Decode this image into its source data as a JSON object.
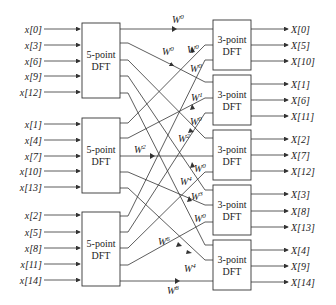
{
  "diagram": {
    "stage1_blocks": [
      {
        "label_line1": "5-point",
        "label_line2": "DFT",
        "inputs": [
          "x[0]",
          "x[3]",
          "x[6]",
          "x[9]",
          "x[12]"
        ]
      },
      {
        "label_line1": "5-point",
        "label_line2": "DFT",
        "inputs": [
          "x[1]",
          "x[4]",
          "x[7]",
          "x[10]",
          "x[13]"
        ]
      },
      {
        "label_line1": "5-point",
        "label_line2": "DFT",
        "inputs": [
          "x[2]",
          "x[5]",
          "x[8]",
          "x[11]",
          "x[14]"
        ]
      }
    ],
    "stage2_blocks": [
      {
        "label_line1": "3-point",
        "label_line2": "DFT",
        "outputs": [
          "X[0]",
          "X[5]",
          "X[10]"
        ]
      },
      {
        "label_line1": "3-point",
        "label_line2": "DFT",
        "outputs": [
          "X[1]",
          "X[6]",
          "X[11]"
        ]
      },
      {
        "label_line1": "3-point",
        "label_line2": "DFT",
        "outputs": [
          "X[2]",
          "X[7]",
          "X[12]"
        ]
      },
      {
        "label_line1": "3-point",
        "label_line2": "DFT",
        "outputs": [
          "X[3]",
          "X[8]",
          "X[13]"
        ]
      },
      {
        "label_line1": "3-point",
        "label_line2": "DFT",
        "outputs": [
          "X[4]",
          "X[9]",
          "X[14]"
        ]
      }
    ],
    "twiddles": [
      {
        "base": "W",
        "exp": "0"
      },
      {
        "base": "W",
        "exp": "0"
      },
      {
        "base": "W",
        "exp": "0"
      },
      {
        "base": "W",
        "exp": "0"
      },
      {
        "base": "W",
        "exp": "1"
      },
      {
        "base": "W",
        "exp": "0"
      },
      {
        "base": "W",
        "exp": "2"
      },
      {
        "base": "W",
        "exp": "2"
      },
      {
        "base": "W",
        "exp": "0"
      },
      {
        "base": "W",
        "exp": "4"
      },
      {
        "base": "W",
        "exp": "3"
      },
      {
        "base": "W",
        "exp": "0"
      },
      {
        "base": "W",
        "exp": "6"
      },
      {
        "base": "W",
        "exp": "4"
      },
      {
        "base": "W",
        "exp": "8"
      }
    ]
  }
}
